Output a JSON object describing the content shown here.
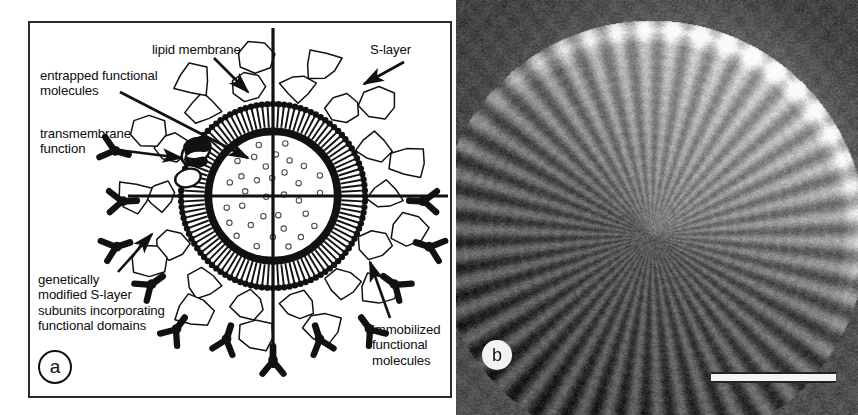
{
  "figure": {
    "type": "two-panel scientific figure",
    "panels": [
      "a",
      "b"
    ]
  },
  "panel_a": {
    "tag": "a",
    "caption_type": "schematic diagram",
    "subject": "S-layer coated liposome / lipid vesicle cross-section",
    "labels": {
      "lipid_membrane": "lipid membrane",
      "entrapped_line1": "entrapped functional",
      "entrapped_line2": "molecules",
      "transmembrane_line1": "transmembrane",
      "transmembrane_line2": "function",
      "s_layer": "S-layer",
      "genetic_line1": "genetically",
      "genetic_line2": "modified S-layer",
      "genetic_line3": "subunits incorporating",
      "genetic_line4": "functional domains",
      "immobilized_line1": "immobilized",
      "immobilized_line2": "functional",
      "immobilized_line3": "molecules"
    },
    "colors": {
      "background": "#ffffff",
      "ink": "#111111",
      "frame": "#2b2b2b"
    },
    "geometry": {
      "center_x": 273,
      "center_y": 196,
      "inner_radius": 62,
      "bilayer_outer_radius": 92,
      "axis_h_from_x": 128,
      "axis_h_to_x": 448,
      "axis_v_from_y": 28,
      "axis_v_to_y": 368
    }
  },
  "panel_b": {
    "tag": "b",
    "caption_type": "electron micrograph",
    "subject": "S-layer coated vesicle showing lattice fringes",
    "scale_bar": {
      "present": true,
      "label": "",
      "style": "white bar with dark outline"
    },
    "colors": {
      "background_dark": "#4a4a4a",
      "particle_bright": "#efefef",
      "tag_background": "#f2f2f2"
    }
  }
}
